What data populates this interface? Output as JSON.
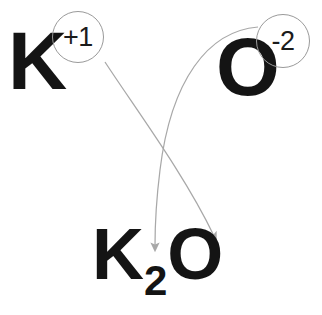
{
  "diagram": {
    "background_color": "#ffffff",
    "ink_color": "#141414",
    "arrow_color": "#a8a8a8",
    "bubble_stroke_color": "#9a9a9a"
  },
  "reactants": {
    "cation": {
      "symbol": "K",
      "charge_label": "+1",
      "charge_value": 1
    },
    "anion": {
      "symbol": "O",
      "charge_label": "-2",
      "charge_value": -2
    }
  },
  "product": {
    "cation_symbol": "K",
    "cation_subscript": "2",
    "anion_symbol": "O",
    "anion_subscript": "",
    "formula_text": "K2O"
  },
  "arrows": [
    {
      "name": "cation-charge-to-anion-subscript",
      "from": "+1",
      "to": "subscript after O",
      "color": "#a8a8a8"
    },
    {
      "name": "anion-charge-to-cation-subscript",
      "from": "-2",
      "to": "subscript after K",
      "color": "#a8a8a8"
    }
  ]
}
